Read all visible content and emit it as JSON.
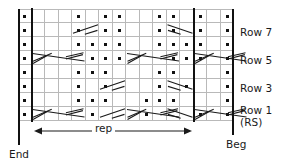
{
  "chart_data": {
    "type": "table",
    "columns": 16,
    "rows": 8,
    "row_order": "bottom-to-top",
    "row_labels": [
      "Row 1",
      "Row 3",
      "Row 5",
      "Row 7"
    ],
    "row_label_extra": "(RS)",
    "repeat_label": "rep",
    "edge_labels": {
      "left": "End",
      "right": "Beg"
    },
    "symbol_legend": {
      "dot": "purl stitch",
      "cable-4-right": "4-stitch right cross cable",
      "cable-2-right": "2-stitch right cross",
      "cable-2-left": "2-stitch left cross"
    },
    "repeat_boundary_columns": [
      1,
      13
    ],
    "purl_dots": [
      {
        "row": 1,
        "cols": [
          0,
          5,
          9,
          13,
          15
        ]
      },
      {
        "row": 2,
        "cols": [
          0,
          4,
          5,
          6,
          9,
          10,
          11,
          15
        ]
      },
      {
        "row": 3,
        "cols": [
          0,
          4,
          6,
          10,
          12,
          15
        ]
      },
      {
        "row": 4,
        "cols": [
          0,
          4,
          5,
          6,
          10,
          11,
          15
        ]
      },
      {
        "row": 5,
        "cols": [
          0,
          5,
          6,
          7,
          11,
          12,
          13,
          15
        ]
      },
      {
        "row": 6,
        "cols": [
          0,
          4,
          5,
          6,
          7,
          10,
          11,
          12,
          13,
          15
        ]
      },
      {
        "row": 7,
        "cols": [
          0,
          4,
          6,
          7,
          10,
          11,
          13,
          15
        ]
      },
      {
        "row": 8,
        "cols": [
          0,
          4,
          6,
          7,
          10,
          11,
          13,
          15
        ]
      }
    ],
    "symbols": [
      {
        "row": 1,
        "col": 1,
        "type": "cable-4-right"
      },
      {
        "row": 1,
        "col": 6,
        "type": "cable-2-left"
      },
      {
        "row": 1,
        "col": 8,
        "type": "cable-4-right"
      },
      {
        "row": 1,
        "col": 11,
        "type": "cable-2-right"
      },
      {
        "row": 1,
        "col": 13,
        "type": "cable-4-right"
      },
      {
        "row": 3,
        "col": 6,
        "type": "cable-2-left"
      },
      {
        "row": 3,
        "col": 11,
        "type": "cable-2-right"
      },
      {
        "row": 5,
        "col": 1,
        "type": "cable-4-right"
      },
      {
        "row": 5,
        "col": 8,
        "type": "cable-4-right"
      },
      {
        "row": 5,
        "col": 13,
        "type": "cable-4-right"
      },
      {
        "row": 7,
        "col": 4,
        "type": "cable-2-left"
      },
      {
        "row": 7,
        "col": 11,
        "type": "cable-2-right"
      }
    ]
  },
  "labels": {
    "row7": "Row 7",
    "row5": "Row 5",
    "row3": "Row 3",
    "row1": "Row 1",
    "rs": "(RS)",
    "rep": "rep",
    "end": "End",
    "beg": "Beg"
  }
}
